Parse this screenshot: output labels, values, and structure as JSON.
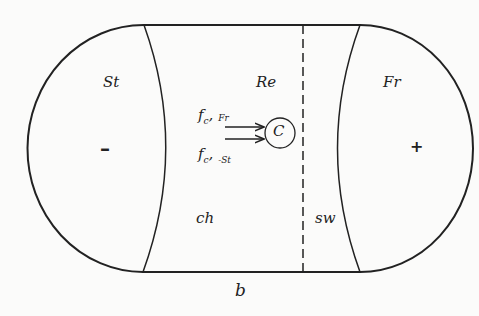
{
  "regions": {
    "left": {
      "label": "St",
      "sign": "–"
    },
    "center": {
      "label": "Re"
    },
    "right": {
      "label": "Fr",
      "sign": "+"
    },
    "channel": {
      "label": "ch"
    },
    "switch": {
      "label": "sw"
    },
    "bottom": {
      "label": "b"
    }
  },
  "node": {
    "label": "C"
  },
  "arrows": [
    {
      "base": "f",
      "sub1": "c",
      "sub2": "Fr"
    },
    {
      "base": "f",
      "sub1": "c",
      "sub2": "-St"
    }
  ],
  "colors": {
    "stroke": "#222222",
    "background": "#fbfbfa"
  }
}
